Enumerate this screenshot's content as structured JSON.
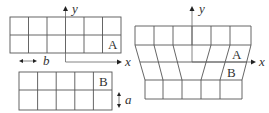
{
  "left_diagram": {
    "grid_a": {
      "label": "A",
      "rows": 2,
      "cols": 6
    },
    "grid_b": {
      "label": "B",
      "rows": 2,
      "cols": 5
    },
    "axis_x_label": "x",
    "axis_y_label": "y",
    "dimension_b_label": "b",
    "dimension_a_label": "a"
  },
  "right_diagram": {
    "label_a": "A",
    "label_b": "B",
    "axis_x_label": "x",
    "axis_y_label": "y",
    "top_rows": 2,
    "top_cols": 6,
    "bottom_rows": 2,
    "bottom_cols": 5
  },
  "colors": {
    "line": "#555555",
    "text": "#333333",
    "background": "#ffffff"
  }
}
